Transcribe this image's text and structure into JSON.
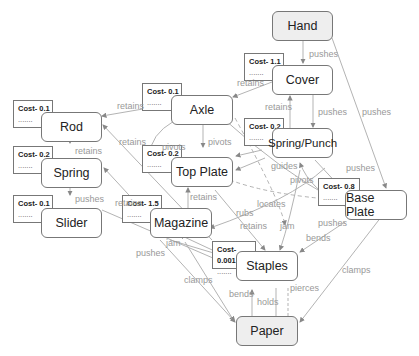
{
  "diagram": {
    "nodes": [
      {
        "id": "hand",
        "label": "Hand",
        "terminal": true
      },
      {
        "id": "cover",
        "label": "Cover"
      },
      {
        "id": "axle",
        "label": "Axle"
      },
      {
        "id": "rod",
        "label": "Rod"
      },
      {
        "id": "spring_punch",
        "label": "Spring/Punch"
      },
      {
        "id": "spring",
        "label": "Spring"
      },
      {
        "id": "top_plate",
        "label": "Top Plate"
      },
      {
        "id": "base_plate",
        "label": "Base Plate"
      },
      {
        "id": "slider",
        "label": "Slider"
      },
      {
        "id": "magazine",
        "label": "Magazine"
      },
      {
        "id": "staples",
        "label": "Staples"
      },
      {
        "id": "paper",
        "label": "Paper",
        "terminal": true
      }
    ],
    "costs": [
      {
        "node": "cover",
        "label": "Cost- 1.1",
        "dots": "......."
      },
      {
        "node": "axle",
        "label": "Cost- 0.1",
        "dots": "......."
      },
      {
        "node": "rod",
        "label": "Cost- 0.1",
        "dots": "......."
      },
      {
        "node": "spring_punch",
        "label": "Cost- 0.2",
        "dots": "......."
      },
      {
        "node": "spring",
        "label": "Cost- 0.2",
        "dots": "......."
      },
      {
        "node": "top_plate",
        "label": "Cost- 0.2",
        "dots": "......."
      },
      {
        "node": "base_plate",
        "label": "Cost- 0.8",
        "dots": "......."
      },
      {
        "node": "slider",
        "label": "Cost- 0.1",
        "dots": "......."
      },
      {
        "node": "magazine",
        "label": "Cost- 1.5",
        "dots": "......."
      },
      {
        "node": "staples",
        "label": "Cost- 0.001",
        "dots": "......."
      }
    ],
    "edges": [
      {
        "from": "hand",
        "to": "cover",
        "label": "pushes"
      },
      {
        "from": "hand",
        "to": "base_plate",
        "label": "pushes"
      },
      {
        "from": "cover",
        "to": "axle",
        "label": "retains"
      },
      {
        "from": "cover",
        "to": "spring_punch",
        "label": "pushes"
      },
      {
        "from": "spring_punch",
        "to": "cover",
        "label": "retains"
      },
      {
        "from": "axle",
        "to": "rod",
        "label": "retains"
      },
      {
        "from": "axle",
        "to": "top_plate",
        "label": "pivots"
      },
      {
        "from": "axle",
        "to": "top_plate",
        "label": "pivots"
      },
      {
        "from": "axle",
        "to": "base_plate",
        "label": "pivots"
      },
      {
        "from": "rod",
        "to": "spring",
        "label": "retains"
      },
      {
        "from": "spring",
        "to": "slider",
        "label": "pushes"
      },
      {
        "from": "staples",
        "to": "rod",
        "label": "retains"
      },
      {
        "from": "magazine",
        "to": "spring",
        "label": "retains"
      },
      {
        "from": "spring_punch",
        "to": "top_plate",
        "label": "guides"
      },
      {
        "from": "spring_punch",
        "to": "base_plate",
        "label": "pushes"
      },
      {
        "from": "spring_punch",
        "to": "staples",
        "label": "pushes"
      },
      {
        "from": "top_plate",
        "to": "base_plate",
        "label": "locates"
      },
      {
        "from": "base_plate",
        "to": "magazine",
        "label": "rubs"
      },
      {
        "from": "magazine",
        "to": "top_plate",
        "label": "retains"
      },
      {
        "from": "top_plate",
        "to": "staples",
        "label": "retains"
      },
      {
        "from": "base_plate",
        "to": "spring_punch",
        "label": "jam"
      },
      {
        "from": "base_plate",
        "to": "staples",
        "label": "bends"
      },
      {
        "from": "staples",
        "to": "magazine",
        "label": "jam"
      },
      {
        "from": "slider",
        "to": "staples",
        "label": "pushes"
      },
      {
        "from": "magazine",
        "to": "staples",
        "label": "pushes"
      },
      {
        "from": "magazine",
        "to": "paper",
        "label": "clamps"
      },
      {
        "from": "base_plate",
        "to": "paper",
        "label": "clamps"
      },
      {
        "from": "paper",
        "to": "staples",
        "label": "bends"
      },
      {
        "from": "staples",
        "to": "paper",
        "label": "holds"
      },
      {
        "from": "staples",
        "to": "paper",
        "label": "pierces"
      }
    ]
  },
  "labels": {
    "hand": "Hand",
    "cover": "Cover",
    "axle": "Axle",
    "rod": "Rod",
    "spring_punch": "Spring/Punch",
    "spring": "Spring",
    "top_plate": "Top Plate",
    "base_plate": "Base Plate",
    "slider": "Slider",
    "magazine": "Magazine",
    "staples": "Staples",
    "paper": "Paper",
    "cost_cover": "Cost- 1.1",
    "cost_axle": "Cost- 0.1",
    "cost_rod": "Cost- 0.1",
    "cost_spring_punch": "Cost- 0.2",
    "cost_spring": "Cost- 0.2",
    "cost_top_plate": "Cost- 0.2",
    "cost_base_plate": "Cost- 0.8",
    "cost_slider": "Cost- 0.1",
    "cost_magazine": "Cost- 1.5",
    "cost_staples": "Cost- 0.001",
    "dots": ".......",
    "e_pushes": "pushes",
    "e_retains": "retains",
    "e_pivots": "pivots",
    "e_guides": "guides",
    "e_locates": "locates",
    "e_rubs": "rubs",
    "e_jam": "jam",
    "e_bends": "bends",
    "e_clamps": "clamps",
    "e_holds": "holds",
    "e_pierces": "pierces"
  },
  "colors": {
    "edge": "#999999",
    "node_border": "#777777",
    "terminal_fill": "#eeeeee",
    "edge_label": "#999999"
  }
}
